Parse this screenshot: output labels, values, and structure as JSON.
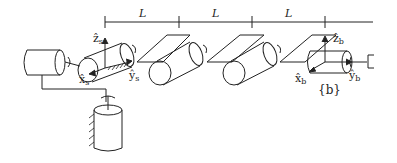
{
  "diagram": {
    "dimension_labels": [
      "L",
      "L",
      "L"
    ],
    "frames": {
      "s": {
        "x_axis": "x̂",
        "x_sub": "s",
        "y_axis": "ŷ",
        "y_sub": "s",
        "z_axis": "ẑ",
        "z_sub": "s"
      },
      "b": {
        "x_axis": "x̂",
        "x_sub": "b",
        "y_axis": "ŷ",
        "y_sub": "b",
        "z_axis": "ẑ",
        "z_sub": "b",
        "label": "{b}"
      }
    },
    "colors": {
      "stroke": "#222222",
      "background": "#ffffff"
    }
  }
}
